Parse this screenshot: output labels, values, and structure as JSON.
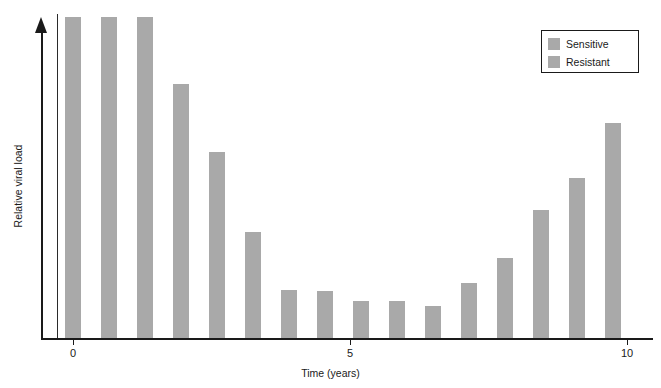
{
  "chart_data": {
    "type": "bar",
    "title": "",
    "xlabel": "Time (years)",
    "ylabel": "Relative viral load",
    "xlim": [
      -0.3,
      10.4
    ],
    "ylim": [
      0,
      100
    ],
    "xticks": [
      0,
      5,
      10
    ],
    "xticklabels": [
      "0",
      "5",
      "10"
    ],
    "yticks": [],
    "yticklabels": [],
    "grid": false,
    "legend_position": "top-right",
    "bar_color": "#a9a9a9",
    "axis_color": "#1a1a1a",
    "background": "#ffffff",
    "series": [
      {
        "name": "Sensitive",
        "color": "#a9a9a9",
        "x": [
          0,
          0.65,
          1.3,
          1.95,
          2.6,
          3.25
        ],
        "values": [
          100,
          100,
          100,
          79,
          58,
          33
        ]
      },
      {
        "name": "Resistant",
        "color": "#a9a9a9",
        "x": [
          3.9,
          4.55,
          5.2,
          5.85,
          6.5,
          7.15,
          7.8,
          8.45,
          9.1,
          9.75
        ],
        "values": [
          15,
          14.5,
          11.5,
          11.5,
          10,
          17,
          25,
          40,
          50,
          67
        ]
      }
    ],
    "all_bars": {
      "x": [
        0,
        0.65,
        1.3,
        1.95,
        2.6,
        3.25,
        3.9,
        4.55,
        5.2,
        5.85,
        6.5,
        7.15,
        7.8,
        8.45,
        9.1,
        9.75
      ],
      "values": [
        100,
        100,
        100,
        79,
        58,
        33,
        15,
        14.5,
        11.5,
        11.5,
        10,
        17,
        25,
        40,
        50,
        67
      ]
    },
    "annotations": []
  },
  "legend": {
    "items": [
      {
        "label": "Sensitive",
        "color": "#a9a9a9"
      },
      {
        "label": "Resistant",
        "color": "#a9a9a9"
      }
    ]
  },
  "axes": {
    "x_title": "Time (years)",
    "y_title": "Relative viral load",
    "tick_labels": [
      "0",
      "5",
      "10"
    ]
  }
}
